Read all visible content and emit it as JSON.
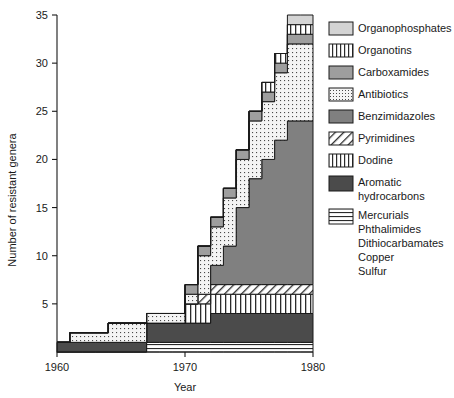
{
  "chart_data": {
    "type": "area",
    "title": "",
    "xlabel": "Year",
    "ylabel": "Number of resistant genera",
    "xlim": [
      1960,
      1980
    ],
    "ylim": [
      0,
      35
    ],
    "xticks": [
      1960,
      1970,
      1980
    ],
    "yticks": [
      0,
      5,
      10,
      15,
      20,
      25,
      30,
      35
    ],
    "xtick_labels": [
      "1960",
      "1970",
      "1980"
    ],
    "ytick_labels": [
      "0",
      "5",
      "10",
      "15",
      "20",
      "25",
      "30",
      "35"
    ],
    "grid": false,
    "legend_position": "right",
    "stacking": "stacked-step",
    "x": [
      1960,
      1961,
      1962,
      1963,
      1964,
      1965,
      1966,
      1967,
      1968,
      1969,
      1970,
      1971,
      1972,
      1973,
      1974,
      1975,
      1976,
      1977,
      1978,
      1979,
      1980
    ],
    "series": [
      {
        "name": "Mercurials Phthalimides Dithiocarbamates Copper Sulfur",
        "pattern": "horizontal-stripes",
        "color": "#ffffff",
        "values": [
          0,
          0,
          0,
          0,
          0,
          0,
          0,
          1,
          1,
          1,
          1,
          1,
          1,
          1,
          1,
          1,
          1,
          1,
          1,
          1,
          1
        ]
      },
      {
        "name": "Aromatic hydrocarbons",
        "pattern": "solid",
        "color": "#4b4b4b",
        "values": [
          1,
          1,
          1,
          1,
          1,
          1,
          1,
          2,
          2,
          2,
          2,
          2,
          3,
          3,
          3,
          3,
          3,
          3,
          3,
          3,
          3
        ]
      },
      {
        "name": "Dodine",
        "pattern": "vertical-stripes",
        "color": "#ffffff",
        "values": [
          0,
          0,
          0,
          0,
          0,
          0,
          0,
          0,
          0,
          0,
          2,
          2,
          2,
          2,
          2,
          2,
          2,
          2,
          2,
          2,
          2
        ]
      },
      {
        "name": "Pyrimidines",
        "pattern": "diagonal-hatch",
        "color": "#ffffff",
        "values": [
          0,
          0,
          0,
          0,
          0,
          0,
          0,
          0,
          0,
          0,
          0,
          1,
          1,
          1,
          1,
          1,
          1,
          1,
          1,
          1,
          1
        ]
      },
      {
        "name": "Benzimidazoles",
        "pattern": "solid",
        "color": "#808080",
        "values": [
          0,
          0,
          0,
          0,
          0,
          0,
          0,
          0,
          0,
          0,
          0,
          0,
          2,
          4,
          8,
          11,
          13,
          15,
          17,
          17,
          17
        ]
      },
      {
        "name": "Antibiotics",
        "pattern": "dotted-grid",
        "color": "#f2f2f2",
        "values": [
          0,
          1,
          1,
          1,
          2,
          2,
          2,
          1,
          1,
          1,
          1,
          4,
          4,
          5,
          5,
          6,
          6,
          7,
          8,
          8,
          8
        ]
      },
      {
        "name": "Carboxamides",
        "pattern": "solid",
        "color": "#9e9e9e",
        "values": [
          0,
          0,
          0,
          0,
          0,
          0,
          0,
          0,
          0,
          0,
          1,
          1,
          1,
          1,
          1,
          1,
          1,
          1,
          1,
          1,
          1
        ]
      },
      {
        "name": "Organotins",
        "pattern": "vertical-stripes",
        "color": "#ffffff",
        "values": [
          0,
          0,
          0,
          0,
          0,
          0,
          0,
          0,
          0,
          0,
          0,
          0,
          0,
          0,
          0,
          0,
          1,
          1,
          1,
          1,
          1
        ]
      },
      {
        "name": "Organophosphates",
        "pattern": "solid",
        "color": "#d4d4d4",
        "values": [
          0,
          0,
          0,
          0,
          0,
          0,
          0,
          0,
          0,
          0,
          0,
          0,
          0,
          0,
          0,
          0,
          0,
          0,
          1,
          1,
          1
        ]
      }
    ],
    "totals": [
      1,
      2,
      2,
      2,
      3,
      3,
      3,
      4,
      4,
      4,
      7,
      9,
      13,
      15,
      20,
      24,
      27,
      30,
      34,
      34,
      34
    ],
    "legend": [
      {
        "label": "Organophosphates",
        "pattern": "solid",
        "color": "#d4d4d4"
      },
      {
        "label": "Organotins",
        "pattern": "vertical-stripes",
        "color": "#ffffff"
      },
      {
        "label": "Carboxamides",
        "pattern": "solid",
        "color": "#9e9e9e"
      },
      {
        "label": "Antibiotics",
        "pattern": "dotted-grid",
        "color": "#f2f2f2"
      },
      {
        "label": "Benzimidazoles",
        "pattern": "solid",
        "color": "#808080"
      },
      {
        "label": "Pyrimidines",
        "pattern": "diagonal-hatch",
        "color": "#ffffff"
      },
      {
        "label": "Dodine",
        "pattern": "vertical-stripes",
        "color": "#ffffff"
      },
      {
        "label": "Aromatic",
        "label2": "hydrocarbons",
        "pattern": "solid",
        "color": "#4b4b4b"
      },
      {
        "label": "Mercurials",
        "label2": "Phthalimides",
        "label3": "Dithiocarbamates",
        "label4": "Copper",
        "label5": "Sulfur",
        "pattern": "horizontal-stripes",
        "color": "#ffffff"
      }
    ]
  },
  "axes": {
    "y_title": "Number of resistant genera",
    "x_title": "Year"
  },
  "colors": {
    "ink": "#1a1a1a",
    "background": "#ffffff",
    "dark_gray": "#4b4b4b",
    "mid_gray": "#808080",
    "carboxamide_gray": "#9e9e9e",
    "light_gray": "#d4d4d4",
    "very_light": "#f2f2f2"
  }
}
